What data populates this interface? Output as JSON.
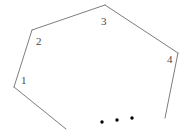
{
  "figure": {
    "type": "polygon-partial-diagram",
    "width": 193,
    "height": 132,
    "background_color": "#ffffff",
    "stroke_color": "#6e6e6e",
    "stroke_width": 0.9,
    "label_color": "#4a4a4a",
    "label_font_size": 11,
    "vertices": [
      {
        "id": "1",
        "label": "1",
        "x": 14,
        "y": 87,
        "label_x": 21,
        "label_y": 75
      },
      {
        "id": "2",
        "label": "2",
        "x": 32,
        "y": 30,
        "label_x": 36,
        "label_y": 36
      },
      {
        "id": "3",
        "label": "3",
        "x": 105,
        "y": 5,
        "label_x": 101,
        "label_y": 16
      },
      {
        "id": "4",
        "label": "4",
        "x": 178,
        "y": 53,
        "label_x": 167,
        "label_y": 54
      }
    ],
    "open_endpoints": [
      {
        "id": "left-tail-end",
        "x": 66,
        "y": 129
      },
      {
        "id": "right-tail-end",
        "x": 165,
        "y": 118
      }
    ],
    "edges": [
      {
        "id": "edge-left-tail",
        "from_x": 66,
        "from_y": 129,
        "to_x": 14,
        "to_y": 87
      },
      {
        "id": "edge-1-2",
        "from_x": 14,
        "from_y": 87,
        "to_x": 32,
        "to_y": 30
      },
      {
        "id": "edge-2-3",
        "from_x": 32,
        "from_y": 30,
        "to_x": 105,
        "to_y": 5
      },
      {
        "id": "edge-3-4",
        "from_x": 105,
        "from_y": 5,
        "to_x": 178,
        "to_y": 53
      },
      {
        "id": "edge-right-tail",
        "from_x": 178,
        "from_y": 53,
        "to_x": 165,
        "to_y": 118
      }
    ],
    "ellipsis_dots": [
      {
        "id": "dot-1",
        "x": 102,
        "y": 122,
        "r": 1.7
      },
      {
        "id": "dot-2",
        "x": 117,
        "y": 120,
        "r": 1.7
      },
      {
        "id": "dot-3",
        "x": 132,
        "y": 118,
        "r": 1.7
      }
    ]
  }
}
